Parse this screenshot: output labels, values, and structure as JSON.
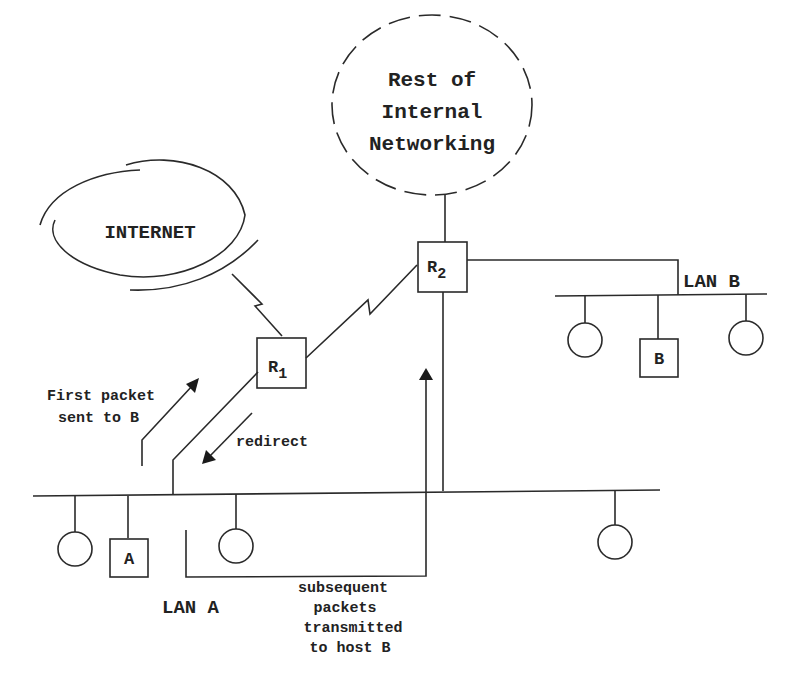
{
  "diagram": {
    "clouds": {
      "internal": {
        "lines": [
          "Rest of",
          "Internal",
          "Networking"
        ]
      },
      "internet": {
        "label": "INTERNET"
      }
    },
    "routers": {
      "r1": {
        "base": "R",
        "sub": "1"
      },
      "r2": {
        "base": "R",
        "sub": "2"
      }
    },
    "hosts": {
      "a": "A",
      "b": "B"
    },
    "lans": {
      "a": "LAN A",
      "b": "LAN B"
    },
    "annotations": {
      "first_packet": [
        "First packet",
        "sent to B"
      ],
      "redirect": "redirect",
      "subsequent": [
        "subsequent",
        "packets",
        "transmitted",
        "to host B"
      ]
    },
    "colors": {
      "ink": "#2a2a2a",
      "background": "#ffffff"
    }
  }
}
